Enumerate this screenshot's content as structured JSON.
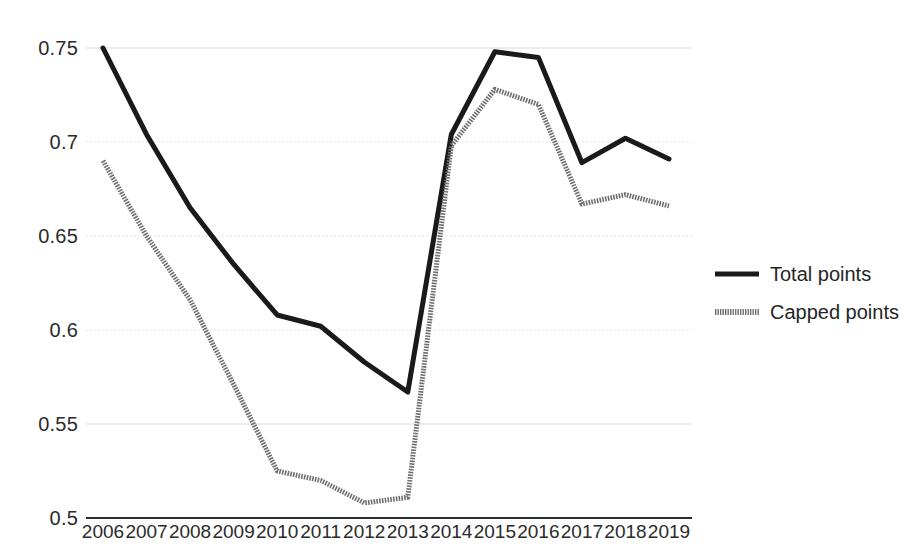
{
  "chart_data": {
    "type": "line",
    "title": "",
    "xlabel": "",
    "ylabel": "",
    "categories": [
      "2006",
      "2007",
      "2008",
      "2009",
      "2010",
      "2011",
      "2012",
      "2013",
      "2014",
      "2015",
      "2016",
      "2017",
      "2018",
      "2019"
    ],
    "x": [
      2006,
      2007,
      2008,
      2009,
      2010,
      2011,
      2012,
      2013,
      2014,
      2015,
      2016,
      2017,
      2018,
      2019
    ],
    "series": [
      {
        "name": "Total points",
        "color": "#1a1a1a",
        "style": "solid",
        "width": 5,
        "values": [
          0.75,
          0.704,
          0.665,
          0.635,
          0.608,
          0.602,
          0.583,
          0.567,
          0.704,
          0.748,
          0.745,
          0.689,
          0.702,
          0.691
        ]
      },
      {
        "name": "Capped points",
        "color": "#6e6e6e",
        "style": "dotted-texture",
        "width": 5,
        "values": [
          0.69,
          0.65,
          0.616,
          0.571,
          0.525,
          0.52,
          0.508,
          0.511,
          0.698,
          0.728,
          0.72,
          0.667,
          0.672,
          0.666
        ]
      }
    ],
    "ylim": [
      0.5,
      0.75
    ],
    "yticks": [
      0.75,
      0.7,
      0.65,
      0.6,
      0.55,
      0.5
    ],
    "ytick_labels": [
      "0.75",
      "0.7",
      "0.65",
      "0.6",
      "0.55",
      "0.5"
    ],
    "grid": true,
    "grid_color": "#d9d9d9",
    "axis_color": "#2b2b2b",
    "legend_position": "right"
  },
  "legend": {
    "entries": [
      {
        "label": "Total points"
      },
      {
        "label": "Capped points"
      }
    ]
  },
  "axes": {
    "y_labels": [
      "0.75",
      "0.7",
      "0.65",
      "0.6",
      "0.55",
      "0.5"
    ],
    "x_labels": [
      "2006",
      "2007",
      "2008",
      "2009",
      "2010",
      "2011",
      "2012",
      "2013",
      "2014",
      "2015",
      "2016",
      "2017",
      "2018",
      "2019"
    ]
  }
}
